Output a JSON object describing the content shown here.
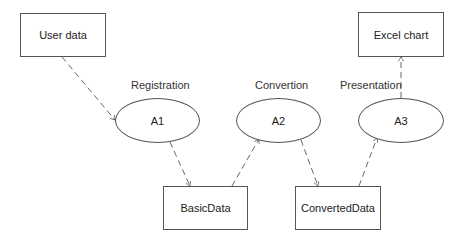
{
  "diagram": {
    "entities": [
      {
        "id": "user_data",
        "label": "User data"
      },
      {
        "id": "excel_chart",
        "label": "Excel chart"
      },
      {
        "id": "basic_data",
        "label": "BasicData"
      },
      {
        "id": "converted_data",
        "label": "ConvertedData"
      }
    ],
    "processes": [
      {
        "id": "a1",
        "label": "A1",
        "caption": "Registration"
      },
      {
        "id": "a2",
        "label": "A2",
        "caption": "Convertion"
      },
      {
        "id": "a3",
        "label": "A3",
        "caption": "Presentation"
      }
    ],
    "edges": [
      {
        "from": "user_data",
        "to": "a1",
        "style": "dashed"
      },
      {
        "from": "a1",
        "to": "basic_data",
        "style": "dashed"
      },
      {
        "from": "basic_data",
        "to": "a2",
        "style": "dashed"
      },
      {
        "from": "a2",
        "to": "converted_data",
        "style": "dashed"
      },
      {
        "from": "converted_data",
        "to": "a3",
        "style": "dashed"
      },
      {
        "from": "a3",
        "to": "excel_chart",
        "style": "dashed"
      }
    ]
  }
}
